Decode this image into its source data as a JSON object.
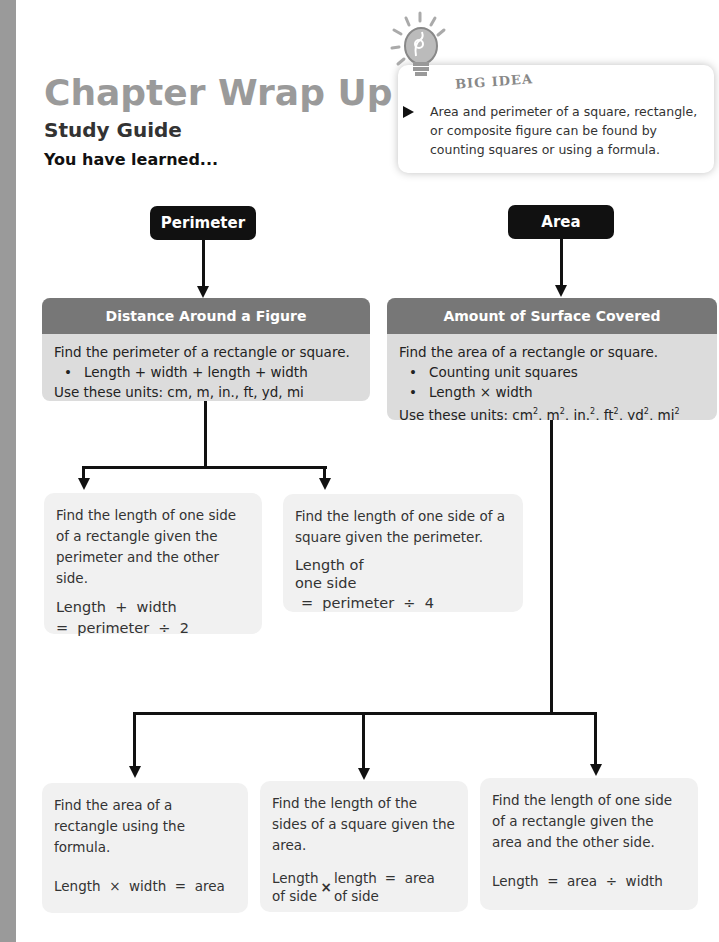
{
  "header": {
    "title": "Chapter Wrap Up",
    "subtitle": "Study Guide",
    "intro": "You have learned..."
  },
  "big_idea": {
    "label": "BIG IDEA",
    "icon": "lightbulb-icon",
    "text": "Area and perimeter of a square, rectangle, or composite figure can be found by counting squares or using a formula."
  },
  "perimeter": {
    "label": "Perimeter",
    "card": {
      "heading": "Distance Around a Figure",
      "line1": "Find the perimeter of a rectangle or square.",
      "bullet1": "Length + width + length + width",
      "units": "Use these units: cm, m, in., ft, yd, mi"
    },
    "branches": [
      {
        "text": "Find the length of one side of a rectangle given the perimeter and the other side.",
        "formula_line1": "Length  +  width",
        "formula_line2": "=  perimeter  ÷  2"
      },
      {
        "text": "Find the length of one side of a square given the perimeter.",
        "formula_left_top": "Length of",
        "formula_left_bottom": "one side",
        "formula_right": "=  perimeter  ÷  4"
      }
    ]
  },
  "area": {
    "label": "Area",
    "card": {
      "heading": "Amount of Surface Covered",
      "line1": "Find the area of a rectangle or square.",
      "bullet1": "Counting unit squares",
      "bullet2": "Length × width",
      "units_prefix": "Use these units: ",
      "units": [
        "cm",
        "m",
        "in.",
        "ft",
        "yd",
        "mi"
      ],
      "units_exp": "2"
    },
    "branches": [
      {
        "text": "Find the area of a rectangle using the formula.",
        "formula": "Length  ×  width  =  area"
      },
      {
        "text": "Find the length of the sides of a square given the area.",
        "f_a_top": "Length",
        "f_a_bottom": "of side",
        "f_op": "×",
        "f_b_top": "length",
        "f_b_bottom": "of side",
        "f_right": "=  area"
      },
      {
        "text": "Find the length of one side of a rectangle given the area and the other side.",
        "formula": "Length  =  area  ÷  width"
      }
    ]
  },
  "colors": {
    "stripe": "#9a9a9a",
    "title": "#9a9a9a",
    "pill": "#111111",
    "card_head": "#777777",
    "card_body": "#dcdcdc",
    "box": "#f1f1f1"
  }
}
